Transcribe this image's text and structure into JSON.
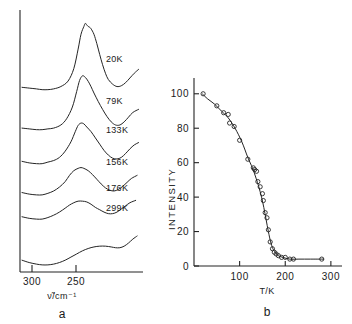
{
  "figure": {
    "panels": [
      {
        "letter": "a",
        "type": "spectra-stack",
        "xlabel": "ν̃/cm⁻¹",
        "x_ticks": [
          300,
          250
        ],
        "x_tick_labels": [
          "300",
          "250"
        ],
        "traces": [
          {
            "label": "20K",
            "temperature_K": 20
          },
          {
            "label": "79K",
            "temperature_K": 79
          },
          {
            "label": "133K",
            "temperature_K": 133
          },
          {
            "label": "156K",
            "temperature_K": 156
          },
          {
            "label": "176K",
            "temperature_K": 176
          },
          {
            "label": "299K",
            "temperature_K": 299
          }
        ]
      },
      {
        "letter": "b",
        "type": "scatter-with-fit",
        "xlabel": "T/K",
        "ylabel": "INTENSITY",
        "x_ticks": [
          100,
          200,
          300
        ],
        "x_tick_labels": [
          "100",
          "200",
          "300"
        ],
        "y_ticks": [
          0,
          20,
          40,
          60,
          80,
          100
        ],
        "y_tick_labels": [
          "0",
          "20",
          "40",
          "60",
          "80",
          "100"
        ]
      }
    ]
  },
  "chart_data": [
    {
      "type": "line",
      "title": "",
      "subtitle": "",
      "xlabel": "ν̃/cm⁻¹",
      "ylabel": "",
      "xlim": [
        310,
        228
      ],
      "grid": false,
      "legend": "inline-right",
      "notes": "Temperature-dependent Raman spectra stack; peak near 262 cm-1 sharpens and grows as temperature decreases.",
      "series": [
        {
          "name": "20K",
          "offset_index": 0,
          "points": [
            [
              310,
              6
            ],
            [
              305,
              5
            ],
            [
              300,
              4
            ],
            [
              296,
              3
            ],
            [
              292,
              3
            ],
            [
              288,
              4
            ],
            [
              283,
              7
            ],
            [
              278,
              14
            ],
            [
              274,
              30
            ],
            [
              271,
              55
            ],
            [
              269,
              74
            ],
            [
              267,
              84
            ],
            [
              266,
              88
            ],
            [
              265,
              86
            ],
            [
              264,
              84
            ],
            [
              263,
              83
            ],
            [
              262,
              81
            ],
            [
              260,
              74
            ],
            [
              258,
              62
            ],
            [
              256,
              48
            ],
            [
              254,
              35
            ],
            [
              252,
              24
            ],
            [
              250,
              16
            ],
            [
              247,
              10
            ],
            [
              244,
              7
            ],
            [
              241,
              8
            ],
            [
              238,
              12
            ],
            [
              235,
              18
            ],
            [
              232,
              24
            ],
            [
              229,
              29
            ]
          ]
        },
        {
          "name": "79K",
          "offset_index": 1,
          "points": [
            [
              310,
              5
            ],
            [
              305,
              4
            ],
            [
              300,
              3
            ],
            [
              296,
              3
            ],
            [
              292,
              4
            ],
            [
              288,
              5
            ],
            [
              283,
              9
            ],
            [
              279,
              17
            ],
            [
              275,
              32
            ],
            [
              272,
              52
            ],
            [
              270,
              66
            ],
            [
              268,
              72
            ],
            [
              266,
              70
            ],
            [
              264,
              65
            ],
            [
              262,
              58
            ],
            [
              260,
              50
            ],
            [
              257,
              39
            ],
            [
              254,
              29
            ],
            [
              251,
              20
            ],
            [
              248,
              13
            ],
            [
              245,
              9
            ],
            [
              242,
              9
            ],
            [
              239,
              13
            ],
            [
              236,
              19
            ],
            [
              233,
              25
            ],
            [
              229,
              29
            ]
          ]
        },
        {
          "name": "133K",
          "offset_index": 2,
          "points": [
            [
              310,
              6
            ],
            [
              305,
              4
            ],
            [
              300,
              3
            ],
            [
              296,
              3
            ],
            [
              292,
              5
            ],
            [
              288,
              7
            ],
            [
              284,
              11
            ],
            [
              280,
              19
            ],
            [
              276,
              31
            ],
            [
              273,
              44
            ],
            [
              271,
              52
            ],
            [
              269,
              55
            ],
            [
              267,
              54
            ],
            [
              265,
              50
            ],
            [
              262,
              44
            ],
            [
              259,
              36
            ],
            [
              256,
              28
            ],
            [
              253,
              20
            ],
            [
              250,
              14
            ],
            [
              247,
              10
            ],
            [
              244,
              9
            ],
            [
              241,
              11
            ],
            [
              238,
              16
            ],
            [
              235,
              22
            ],
            [
              232,
              27
            ],
            [
              229,
              30
            ]
          ]
        },
        {
          "name": "156K",
          "offset_index": 3,
          "points": [
            [
              310,
              7
            ],
            [
              305,
              5
            ],
            [
              300,
              4
            ],
            [
              296,
              4
            ],
            [
              292,
              6
            ],
            [
              288,
              9
            ],
            [
              284,
              14
            ],
            [
              280,
              21
            ],
            [
              277,
              29
            ],
            [
              274,
              35
            ],
            [
              271,
              38
            ],
            [
              269,
              39
            ],
            [
              267,
              38
            ],
            [
              264,
              35
            ],
            [
              261,
              30
            ],
            [
              258,
              24
            ],
            [
              255,
              18
            ],
            [
              252,
              13
            ],
            [
              249,
              10
            ],
            [
              246,
              9
            ],
            [
              243,
              11
            ],
            [
              240,
              15
            ],
            [
              237,
              20
            ],
            [
              234,
              25
            ],
            [
              230,
              29
            ]
          ]
        },
        {
          "name": "176K",
          "offset_index": 4,
          "points": [
            [
              310,
              8
            ],
            [
              305,
              6
            ],
            [
              300,
              5
            ],
            [
              296,
              5
            ],
            [
              292,
              7
            ],
            [
              288,
              10
            ],
            [
              284,
              14
            ],
            [
              280,
              19
            ],
            [
              277,
              23
            ],
            [
              274,
              26
            ],
            [
              271,
              28
            ],
            [
              268,
              28
            ],
            [
              265,
              27
            ],
            [
              262,
              24
            ],
            [
              259,
              20
            ],
            [
              256,
              17
            ],
            [
              253,
              14
            ],
            [
              250,
              12
            ],
            [
              247,
              12
            ],
            [
              244,
              14
            ],
            [
              241,
              18
            ],
            [
              238,
              22
            ],
            [
              235,
              26
            ],
            [
              231,
              29
            ]
          ]
        },
        {
          "name": "299K",
          "offset_index": 5,
          "points": [
            [
              310,
              10
            ],
            [
              305,
              7
            ],
            [
              300,
              5
            ],
            [
              296,
              4
            ],
            [
              292,
              4
            ],
            [
              288,
              5
            ],
            [
              284,
              7
            ],
            [
              280,
              10
            ],
            [
              276,
              14
            ],
            [
              272,
              18
            ],
            [
              268,
              22
            ],
            [
              264,
              25
            ],
            [
              260,
              27
            ],
            [
              256,
              28
            ],
            [
              252,
              28
            ],
            [
              248,
              27
            ],
            [
              245,
              26
            ],
            [
              242,
              26
            ],
            [
              239,
              28
            ],
            [
              236,
              32
            ],
            [
              233,
              37
            ],
            [
              230,
              41
            ]
          ]
        }
      ]
    },
    {
      "type": "scatter",
      "title": "",
      "xlabel": "T/K",
      "ylabel": "INTENSITY",
      "xlim": [
        0,
        320
      ],
      "ylim": [
        0,
        108
      ],
      "grid": false,
      "legend": "none",
      "notes": "Integrated peak intensity vs temperature; sigmoidal order-disorder transition centred near 150 K. Open-circle markers with smooth fitted curve.",
      "x": [
        20,
        50,
        65,
        75,
        78,
        88,
        100,
        118,
        130,
        133,
        137,
        140,
        145,
        150,
        152,
        156,
        160,
        163,
        167,
        172,
        176,
        180,
        185,
        192,
        200,
        210,
        218,
        280
      ],
      "y": [
        100,
        93,
        89,
        88,
        83,
        81,
        73,
        62,
        57,
        56,
        55,
        49,
        46,
        42,
        38,
        31,
        28,
        21,
        14,
        10,
        8,
        7,
        6,
        5,
        5,
        4,
        4,
        4
      ],
      "fit_curve": {
        "x": [
          18,
          30,
          45,
          60,
          75,
          90,
          105,
          118,
          128,
          136,
          142,
          148,
          153,
          158,
          163,
          168,
          173,
          178,
          185,
          195,
          210,
          230,
          255,
          285
        ],
        "y": [
          100,
          97,
          94,
          90,
          86,
          80,
          72,
          63,
          57,
          51,
          46,
          40,
          34,
          27,
          20,
          14,
          10,
          8,
          6,
          5,
          4,
          4,
          4,
          4
        ]
      }
    }
  ]
}
